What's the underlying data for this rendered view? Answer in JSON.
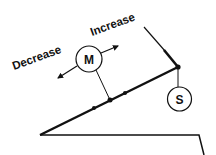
{
  "diagram": {
    "labels": {
      "increase": "Increase",
      "decrease": "Decrease"
    },
    "motor": {
      "symbol": "M"
    },
    "sensor": {
      "symbol": "S"
    },
    "colors": {
      "stroke": "#111111",
      "background": "#ffffff"
    }
  }
}
